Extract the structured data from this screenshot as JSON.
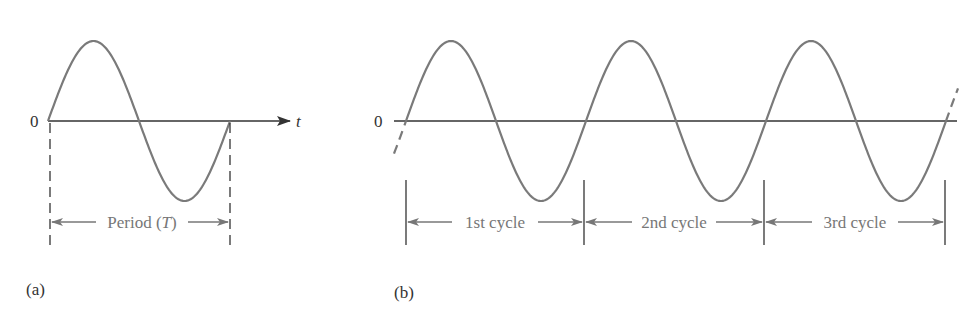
{
  "figure": {
    "panel_a": {
      "label": "(a)",
      "origin_label": "0",
      "axis_label": "t",
      "period_label_prefix": "Period (",
      "period_label_var": "T",
      "period_label_suffix": ")"
    },
    "panel_b": {
      "label": "(b)",
      "origin_label": "0",
      "cycles": [
        "1st cycle",
        "2nd cycle",
        "3rd cycle"
      ]
    },
    "colors": {
      "curve": "#7a7a7a",
      "axis": "#333333",
      "annotation": "#777777"
    }
  }
}
